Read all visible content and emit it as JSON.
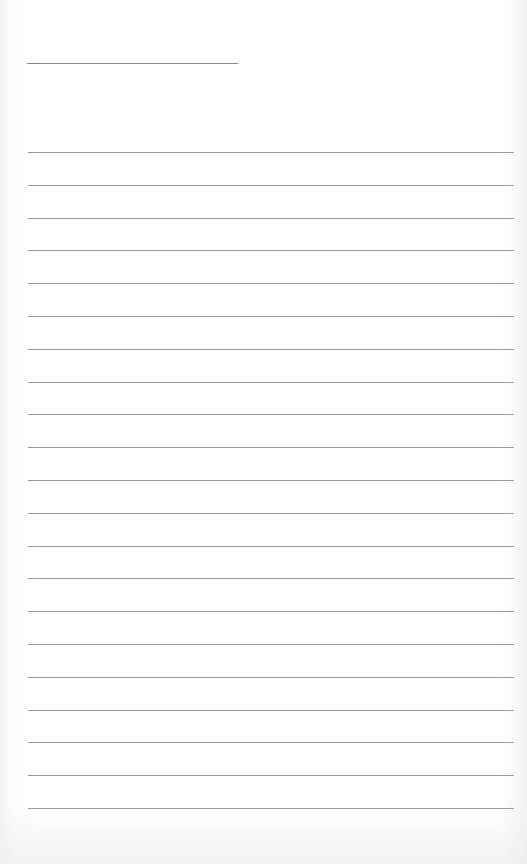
{
  "page": {
    "type": "lined-paper",
    "title_line": {
      "x": 27,
      "y": 63,
      "width": 211
    },
    "rules": {
      "start_y": 152,
      "spacing": 32.8,
      "count": 21,
      "x": 28,
      "width": 486
    },
    "colors": {
      "background": "#ffffff",
      "line": "#9a9a9a"
    }
  }
}
